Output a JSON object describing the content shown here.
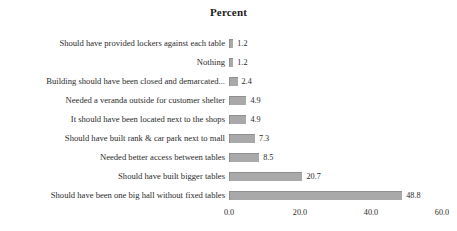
{
  "chart_data": {
    "type": "bar",
    "orientation": "horizontal",
    "title": "Percent",
    "xlabel": "",
    "ylabel": "",
    "xlim": [
      0.0,
      60.0
    ],
    "xticks": [
      "0.0",
      "20.0",
      "40.0",
      "60.0"
    ],
    "xtick_values": [
      0.0,
      20.0,
      40.0,
      60.0
    ],
    "grid": false,
    "legend": null,
    "bar_color": "#a9a9a9",
    "background_color": "#ffffff",
    "categories": [
      "Should have provided lockers against each table",
      "Nothing",
      "Building should have been closed  and demarcated...",
      "Needed a veranda outside for customer shelter",
      "It should have been located next to the shops",
      "Should have built rank & car park next to mall",
      "Needed better access between tables",
      "Should have built bigger tables",
      "Should have been one big hall without fixed tables"
    ],
    "values": [
      1.2,
      1.2,
      2.4,
      4.9,
      4.9,
      7.3,
      8.5,
      20.7,
      48.8
    ],
    "value_labels": [
      "1.2",
      "1.2",
      "2.4",
      "4.9",
      "4.9",
      "7.3",
      "8.5",
      "20.7",
      "48.8"
    ]
  }
}
